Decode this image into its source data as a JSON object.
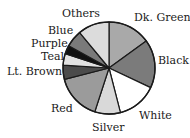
{
  "chart_data": {
    "type": "pie",
    "title": "",
    "center": [
      109,
      68
    ],
    "radius": 46,
    "start_angle_deg": 0,
    "direction": "clockwise",
    "slices": [
      {
        "label": "Dk. Green",
        "value": 15,
        "color": "#a9a9a9"
      },
      {
        "label": "Black",
        "value": 17,
        "color": "#7b7b7b"
      },
      {
        "label": "White",
        "value": 14,
        "color": "#ffffff"
      },
      {
        "label": "Silver",
        "value": 9,
        "color": "#d9d9d9"
      },
      {
        "label": "Red",
        "value": 16,
        "color": "#9b9b9b"
      },
      {
        "label": "Lt. Brown",
        "value": 5,
        "color": "#4b4b4b"
      },
      {
        "label": "Teal",
        "value": 4,
        "color": "#e2e2e2"
      },
      {
        "label": "Purple",
        "value": 3,
        "color": "#111111"
      },
      {
        "label": "Blue",
        "value": 6,
        "color": "#7a7a7a"
      },
      {
        "label": "Others",
        "value": 11,
        "color": "#dcdcdc"
      }
    ],
    "legend": "none (direct labels)"
  },
  "labels": [
    {
      "text": "Others",
      "x": 62,
      "y": 8
    },
    {
      "text": "Dk. Green",
      "x": 134,
      "y": 12
    },
    {
      "text": "Blue",
      "x": 48,
      "y": 25
    },
    {
      "text": "Purple",
      "x": 31,
      "y": 38
    },
    {
      "text": "Black",
      "x": 158,
      "y": 55
    },
    {
      "text": "Teal",
      "x": 41,
      "y": 51
    },
    {
      "text": "Lt. Brown",
      "x": 7,
      "y": 66
    },
    {
      "text": "Red",
      "x": 51,
      "y": 103
    },
    {
      "text": "White",
      "x": 139,
      "y": 110
    },
    {
      "text": "Silver",
      "x": 92,
      "y": 122
    }
  ]
}
